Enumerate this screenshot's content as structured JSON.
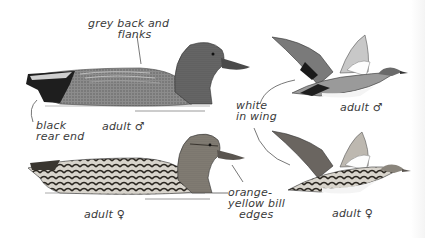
{
  "figure": {
    "birds": [
      {
        "id": "male-swimming",
        "caption": "adult ♂",
        "pose": "swimming"
      },
      {
        "id": "male-flying",
        "caption": "adult ♂",
        "pose": "flying"
      },
      {
        "id": "female-swimming",
        "caption": "adult ♀",
        "pose": "swimming"
      },
      {
        "id": "female-flying",
        "caption": "adult ♀",
        "pose": "flying"
      }
    ],
    "annotations": {
      "grey_back": "grey back and\n        flanks",
      "black_rear": "black\nrear end",
      "white_wing": "white\nin wing",
      "bill_edges": "orange-\nyellow bill\n   edges"
    },
    "colors": {
      "ink": "#2a2a2a",
      "grey_body": "#8a8a8a",
      "dark": "#1e1e1e",
      "female_brown": "#5a5550",
      "background": "#ffffff"
    }
  }
}
